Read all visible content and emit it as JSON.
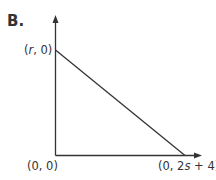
{
  "panel": {
    "label": "B."
  },
  "graph": {
    "points": {
      "y_intercept": {
        "label_prefix": "(",
        "var": "r",
        "label_suffix": ", 0)"
      },
      "origin": {
        "label": "(0, 0)"
      },
      "x_intercept": {
        "label_prefix": "(0, 2",
        "var": "s",
        "label_suffix": " + 4)"
      }
    },
    "axes": {
      "x_arrow": true,
      "y_arrow": true
    },
    "line_color": "#333333"
  }
}
